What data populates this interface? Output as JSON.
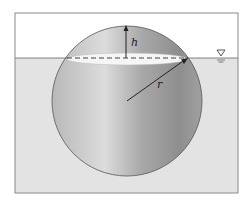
{
  "diagram": {
    "labels": {
      "height": "h",
      "radius": "r"
    },
    "symbols": {
      "water_surface": "water-surface-triangle"
    },
    "colors": {
      "frame": "#8a8a8a",
      "water": "#e3e3e3",
      "air": "#ffffff",
      "sphere_light": "#d9d9d9",
      "sphere_dark": "#8c8c8c",
      "waterline_ellipse": "#f4f4f4"
    },
    "geometry": {
      "frame": {
        "x": 15,
        "y": 13,
        "w": 223,
        "h": 180
      },
      "waterline_y": 58,
      "sphere": {
        "cx": 127,
        "cy": 101,
        "r": 75
      }
    }
  }
}
